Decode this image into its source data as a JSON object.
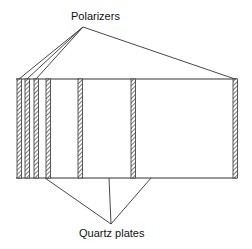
{
  "diagram": {
    "labels": {
      "top": "Polarizers",
      "bottom": "Quartz plates"
    },
    "box": {
      "x1": 16,
      "y1": 79,
      "x2": 237,
      "y2": 178
    },
    "plates": [
      {
        "x": 17,
        "type": "polarizer"
      },
      {
        "x": 25,
        "type": "polarizer"
      },
      {
        "x": 34,
        "type": "polarizer"
      },
      {
        "x": 46,
        "type": "quartz"
      },
      {
        "x": 78,
        "type": "quartz"
      },
      {
        "x": 131,
        "type": "quartz"
      },
      {
        "x": 233,
        "type": "polarizer"
      }
    ],
    "colors": {
      "line": "#333333",
      "hatch": "#444444"
    }
  }
}
